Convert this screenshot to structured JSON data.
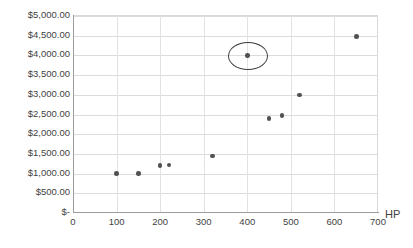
{
  "chart_data": {
    "type": "scatter",
    "title": "",
    "xlabel": "HP",
    "ylabel": "",
    "xlim": [
      0,
      700
    ],
    "ylim": [
      0,
      5000
    ],
    "grid": true,
    "legend": false,
    "x_ticks": [
      "0",
      "100",
      "200",
      "300",
      "400",
      "500",
      "600",
      "700"
    ],
    "x_tick_values": [
      0,
      100,
      200,
      300,
      400,
      500,
      600,
      700
    ],
    "y_ticks": [
      "$-",
      "$500.00",
      "$1,000.00",
      "$1,500.00",
      "$2,000.00",
      "$2,500.00",
      "$3,000.00",
      "$3,500.00",
      "$4,000.00",
      "$4,500.00",
      "$5,000.00"
    ],
    "y_tick_values": [
      0,
      500,
      1000,
      1500,
      2000,
      2500,
      3000,
      3500,
      4000,
      4500,
      5000
    ],
    "points": [
      {
        "x": 100,
        "y": 1000
      },
      {
        "x": 150,
        "y": 1000
      },
      {
        "x": 200,
        "y": 1200
      },
      {
        "x": 220,
        "y": 1220
      },
      {
        "x": 320,
        "y": 1450
      },
      {
        "x": 400,
        "y": 4000
      },
      {
        "x": 450,
        "y": 2400
      },
      {
        "x": 480,
        "y": 2470
      },
      {
        "x": 520,
        "y": 3000
      },
      {
        "x": 650,
        "y": 4480
      }
    ],
    "annotations": [
      {
        "type": "ellipse",
        "x": 400,
        "y": 4000,
        "label": "highlighted-point"
      }
    ],
    "colors": {
      "marker": "#51514f",
      "gridline": "#dcdcdc",
      "axis": "#9c9c9c",
      "text": "#3f3f3f",
      "annotation": "#3d3d3d",
      "background": "#ffffff"
    }
  }
}
